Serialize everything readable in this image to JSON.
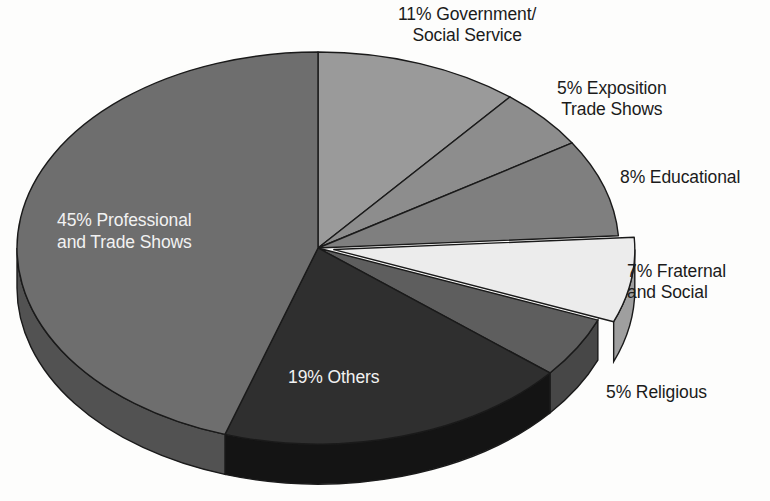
{
  "chart_data": {
    "type": "pie",
    "title": "",
    "subtitle": "",
    "xlabel": "",
    "ylabel": "",
    "legend_position": "none",
    "grid": false,
    "style": "3d-exploded-pie",
    "units": "percent",
    "total": 100,
    "start_angle_deg": 0,
    "direction": "clockwise",
    "categories": [
      "Government/Social Service",
      "Exposition Trade Shows",
      "Educational",
      "Fraternal and Social",
      "Religious",
      "Others",
      "Professional and Trade Shows"
    ],
    "values": [
      11,
      5,
      8,
      7,
      5,
      19,
      45
    ],
    "slices": [
      {
        "key": "government",
        "label": "11% Government/\nSocial Service",
        "name": "Government/Social Service",
        "value": 11,
        "percent_text": "11%",
        "color": "#9a9a9a",
        "side_color": "#7c7c7c",
        "label_color": "#1b1b1b",
        "label_placement": "outside"
      },
      {
        "key": "exposition",
        "label": "5% Exposition\nTrade Shows",
        "name": "Exposition Trade Shows",
        "value": 5,
        "percent_text": "5%",
        "color": "#8d8d8d",
        "side_color": "#6f6f6f",
        "label_color": "#1b1b1b",
        "label_placement": "outside"
      },
      {
        "key": "educational",
        "label": "8% Educational",
        "name": "Educational",
        "value": 8,
        "percent_text": "8%",
        "color": "#7f7f7f",
        "side_color": "#636363",
        "label_color": "#1b1b1b",
        "label_placement": "outside"
      },
      {
        "key": "fraternal",
        "label": "7% Fraternal\nand Social",
        "name": "Fraternal and Social",
        "value": 7,
        "percent_text": "7%",
        "color": "#ececec",
        "side_color": "#9f9f9f",
        "label_color": "#1b1b1b",
        "label_placement": "outside"
      },
      {
        "key": "religious",
        "label": "5% Religious",
        "name": "Religious",
        "value": 5,
        "percent_text": "5%",
        "color": "#5e5e5e",
        "side_color": "#474747",
        "label_color": "#1b1b1b",
        "label_placement": "outside"
      },
      {
        "key": "others",
        "label": "19% Others",
        "name": "Others",
        "value": 19,
        "percent_text": "19%",
        "color": "#2f2f2f",
        "side_color": "#141414",
        "label_color": "#f2f2f2",
        "label_placement": "inside"
      },
      {
        "key": "professional",
        "label": "45% Professional\nand Trade Shows",
        "name": "Professional and Trade Shows",
        "value": 45,
        "percent_text": "45%",
        "color": "#6e6e6e",
        "side_color": "#525252",
        "label_color": "#f2f2f2",
        "label_placement": "inside"
      }
    ],
    "colors": {
      "background": "#fdfdfc",
      "outline": "#1a1a1a",
      "light_text": "#f2f2f2",
      "dark_text": "#1b1b1b"
    }
  }
}
